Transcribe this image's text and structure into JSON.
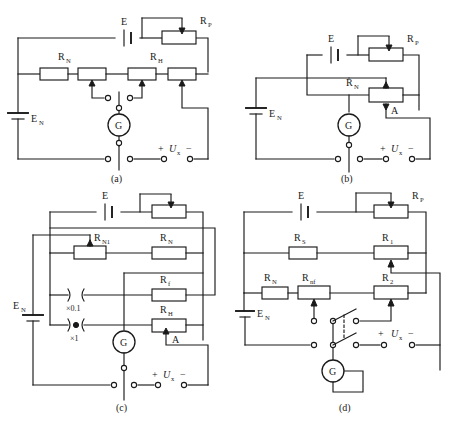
{
  "figure": {
    "background": "#ffffff",
    "line_color": "#1a1a1a"
  },
  "panels": [
    {
      "id": "a",
      "caption": "(a)",
      "labels": {
        "source_e": "E",
        "rp": "R",
        "rp_sub": "P",
        "rn": "R",
        "rn_sub": "N",
        "rh": "R",
        "rh_sub": "H",
        "en": "E",
        "en_sub": "N",
        "galvanometer": "G",
        "ux_plus": "+",
        "ux": "U",
        "ux_sub": "x",
        "ux_minus": "−"
      }
    },
    {
      "id": "b",
      "caption": "(b)",
      "labels": {
        "source_e": "E",
        "rp": "R",
        "rp_sub": "P",
        "rn": "R",
        "rn_sub": "N",
        "point_a": "A",
        "en": "E",
        "en_sub": "N",
        "galvanometer": "G",
        "ux_plus": "+",
        "ux": "U",
        "ux_sub": "x",
        "ux_minus": "−"
      }
    },
    {
      "id": "c",
      "caption": "(c)",
      "labels": {
        "source_e": "E",
        "rp": "R",
        "rp_sub": "P",
        "rn1": "R",
        "rn1_sub": "N1",
        "rn": "R",
        "rn_sub": "N",
        "rf": "R",
        "rf_sub": "f",
        "rh": "R",
        "rh_sub": "H",
        "point_a": "A",
        "en": "E",
        "en_sub": "N",
        "galvanometer": "G",
        "plug_open": "(  )",
        "plug_open_range": "×0.1",
        "plug_closed_range": "×1",
        "ux_plus": "+",
        "ux": "U",
        "ux_sub": "x",
        "ux_minus": "−"
      }
    },
    {
      "id": "d",
      "caption": "(d)",
      "labels": {
        "source_e": "E",
        "rp": "R",
        "rp_sub": "P",
        "rs": "R",
        "rs_sub": "S",
        "r1": "R",
        "r1_sub": "1",
        "rn": "R",
        "rn_sub": "N",
        "rnf": "R",
        "rnf_sub": "nf",
        "r2": "R",
        "r2_sub": "2",
        "en": "E",
        "en_sub": "N",
        "galvanometer": "G",
        "ux_plus": "+",
        "ux": "U",
        "ux_sub": "x",
        "ux_minus": "−"
      }
    }
  ]
}
